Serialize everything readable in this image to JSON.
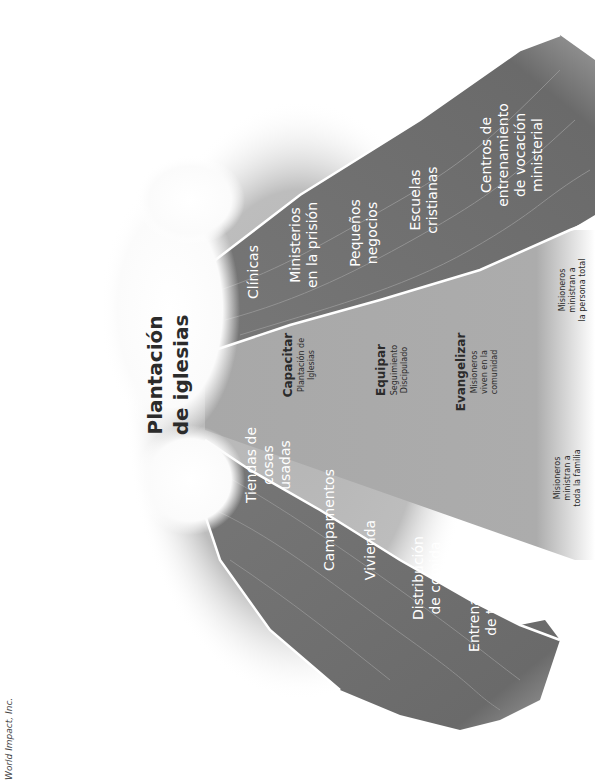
{
  "title": {
    "line1": "Plantación",
    "line2": "de iglesias"
  },
  "center_column": {
    "stages": [
      {
        "heading": "Capacitar",
        "lines": [
          "Plantación de",
          "Iglesias"
        ]
      },
      {
        "heading": "Equipar",
        "lines": [
          "Seguimiento",
          "Discipulado"
        ]
      },
      {
        "heading": "Evangelizar",
        "lines": [
          "Misioneros",
          "viven en la",
          "comunidad"
        ]
      }
    ]
  },
  "upper_wedge": {
    "items": [
      {
        "lines": [
          "Clínicas"
        ]
      },
      {
        "lines": [
          "Ministerios",
          "en la prisión"
        ]
      },
      {
        "lines": [
          "Pequeños",
          "negocios"
        ]
      },
      {
        "lines": [
          "Escuelas",
          "cristianas"
        ]
      },
      {
        "lines": [
          "Centros de",
          "entrenamiento",
          "de vocación",
          "ministerial"
        ]
      }
    ],
    "footnote": [
      "Misioneros",
      "ministran a",
      "la persona total"
    ]
  },
  "lower_wedge": {
    "items": [
      {
        "lines": [
          "Tiendas de",
          "cosas",
          "usadas"
        ]
      },
      {
        "lines": [
          "Campamentos"
        ]
      },
      {
        "lines": [
          "Vivienda"
        ]
      },
      {
        "lines": [
          "Distribución",
          "de comida"
        ]
      },
      {
        "lines": [
          "Entrenamiento",
          "de trabajo"
        ]
      }
    ],
    "footnote": [
      "Misioneros",
      "ministran a",
      "toda la familia"
    ]
  },
  "credit": "World Impact, Inc.",
  "colors": {
    "background": "#ffffff",
    "halo": "#b8b8b8",
    "center_field": "#a9a9a9",
    "wedge": "#6e6e6e",
    "wedge_border": "#ffffff",
    "dark_text": "#2b2b2b"
  }
}
